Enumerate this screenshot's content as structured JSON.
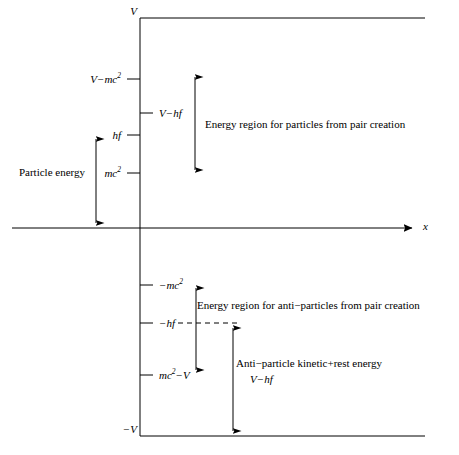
{
  "figure": {
    "type": "energy-level-diagram",
    "background_color": "#ffffff",
    "line_color": "#000000"
  },
  "axes": {
    "x_axis_label": "x",
    "x_axis_y": 228,
    "x_axis_x_start": 12,
    "x_axis_x_end": 417,
    "y_axis_x": 140,
    "y_axis_top": 18,
    "y_axis_bottom": 436
  },
  "step_levels": {
    "top_label": "V",
    "top_y": 18,
    "bottom_label": "−V",
    "bottom_y": 436,
    "line_x_start": 140,
    "line_x_end": 425
  },
  "ticks": [
    {
      "label_html": "V−mc<sup>2</sup>",
      "label_plain": "V−mc2",
      "y": 79,
      "side": "left"
    },
    {
      "label_html": "V−hf",
      "label_plain": "V−hf",
      "y": 113,
      "side": "right"
    },
    {
      "label_html": "hf",
      "label_plain": "hf",
      "y": 135,
      "side": "left"
    },
    {
      "label_html": "mc<sup>2</sup>",
      "label_plain": "mc2",
      "y": 173,
      "side": "left"
    },
    {
      "label_html": "−mc<sup>2</sup>",
      "label_plain": "−mc2",
      "y": 285,
      "side": "right"
    },
    {
      "label_html": "−hf",
      "label_plain": "−hf",
      "y": 323,
      "side": "right"
    },
    {
      "label_html": "mc<sup>2</sup>−V",
      "label_plain": "mc2−V",
      "y": 375,
      "side": "right"
    }
  ],
  "annotations": {
    "particle_energy": {
      "text": "Particle energy",
      "x": 52,
      "y": 172,
      "arrow_x": 96,
      "arrow_top": 134,
      "arrow_bottom": 228,
      "arrow_heads": "both"
    },
    "particle_region": {
      "text": "Energy region for particles from pair creation",
      "x": 205,
      "y": 124,
      "arrow_x": 195,
      "arrow_top": 72,
      "arrow_bottom": 175,
      "arrow_heads": "both"
    },
    "antiparticle_region": {
      "text": "Energy region for anti−particles from pair creation",
      "x": 197,
      "y": 305,
      "arrow_x": 196,
      "arrow_top": 283,
      "arrow_bottom": 375,
      "arrow_heads": "both"
    },
    "antiparticle_energy": {
      "line1": "Anti−particle kinetic+rest energy",
      "line2": "V−hf",
      "line1_x": 236,
      "line1_y": 363,
      "line2_x": 250,
      "line2_y": 378,
      "arrow_x": 233,
      "arrow_top": 323,
      "arrow_bottom": 436,
      "arrow_heads": "both"
    }
  },
  "dashed_line": {
    "name": "minus-hf-dashed-level",
    "y": 323,
    "x_start": 145,
    "x_end": 237
  }
}
